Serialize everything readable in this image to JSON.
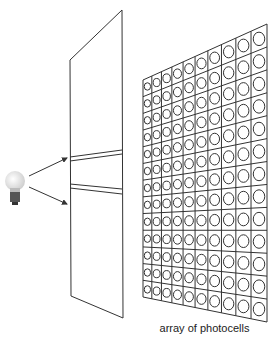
{
  "diagram": {
    "caption": "array of photocells",
    "elements": {
      "light_source": "light-bulb-icon",
      "barrier": "barrier-with-two-slits",
      "detector": "photocell-array"
    },
    "slits": 2,
    "arrows": 2,
    "photocell_array": {
      "columns": 10,
      "rows": 13
    },
    "colors": {
      "line": "#333333",
      "bulb_glass": "#e6e6e6",
      "bulb_base": "#555555"
    }
  }
}
